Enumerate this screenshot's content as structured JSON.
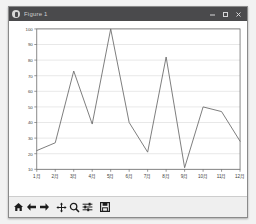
{
  "window": {
    "title": "Figure 1",
    "app_icon_name": "matplotlib-figure-icon",
    "controls": [
      {
        "name": "minimize-button",
        "glyph": "─"
      },
      {
        "name": "maximize-button",
        "glyph": "□"
      },
      {
        "name": "close-button",
        "glyph": "✕"
      }
    ]
  },
  "toolbar": {
    "buttons": [
      {
        "name": "home-button",
        "label": "Home"
      },
      {
        "name": "back-button",
        "label": "Back"
      },
      {
        "name": "forward-button",
        "label": "Forward"
      },
      {
        "name": "pan-button",
        "label": "Pan"
      },
      {
        "name": "zoom-button",
        "label": "Zoom"
      },
      {
        "name": "configure-subplots-button",
        "label": "Configure subplots"
      },
      {
        "name": "save-button",
        "label": "Save"
      }
    ]
  },
  "chart_data": {
    "type": "line",
    "title": "",
    "xlabel": "",
    "ylabel": "",
    "categories": [
      "1月",
      "2月",
      "3月",
      "4月",
      "5月",
      "6月",
      "7月",
      "8月",
      "9月",
      "10月",
      "11月",
      "12月"
    ],
    "values": [
      22,
      27,
      73,
      39,
      100,
      40,
      21,
      82,
      11,
      50,
      47,
      28
    ],
    "series": [
      {
        "name": "series-1",
        "values": [
          22,
          27,
          73,
          39,
          100,
          40,
          21,
          82,
          11,
          50,
          47,
          28
        ]
      }
    ],
    "ylim": [
      10,
      100
    ],
    "yticks": [
      10,
      20,
      30,
      40,
      50,
      60,
      70,
      80,
      90,
      100
    ],
    "ytick_labels": [
      "10",
      "20",
      "30",
      "40",
      "50",
      "60",
      "70",
      "80",
      "90",
      "100"
    ],
    "xtick_labels": [
      "1月",
      "2月",
      "3月",
      "4月",
      "5月",
      "6月",
      "7月",
      "8月",
      "9月",
      "10月",
      "11月",
      "12月"
    ],
    "grid": true,
    "grid_axis": "y",
    "legend": false,
    "legend_position": "none",
    "line_color": "#6e6e6e",
    "grid_color": "#d9d9d9",
    "axes_color": "#6b6b6b",
    "background": "#ffffff"
  }
}
